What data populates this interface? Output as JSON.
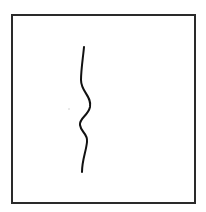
{
  "canvas": {
    "width": 206,
    "height": 212,
    "background": "#ffffff"
  },
  "frame": {
    "border_color": "#2a2a2a",
    "x": 12,
    "y": 15,
    "x2": 195,
    "y2": 203
  },
  "stroke": {
    "color": "#111111",
    "width": 2,
    "path": "M84,47 C83,58 81,70 81,80 C81,92 92,96 90,107 C88,116 79,118 80,125 C81,133 88,133 87,142 C86,152 82,160 82,172"
  },
  "speck": {
    "x": 69,
    "y": 109,
    "color": "#cccccc"
  }
}
